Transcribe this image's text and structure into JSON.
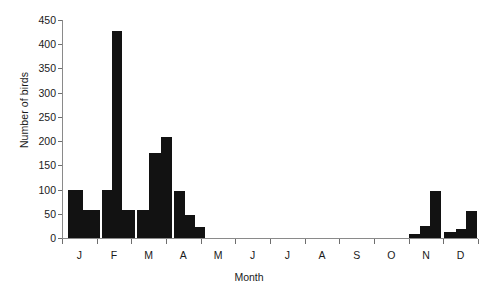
{
  "chart_data": {
    "type": "bar",
    "title": "",
    "xlabel": "Month",
    "ylabel": "Number of birds",
    "ylim": [
      0,
      450
    ],
    "y_ticks": [
      0,
      50,
      100,
      150,
      200,
      250,
      300,
      350,
      400,
      450
    ],
    "y_tick_labels": [
      "0",
      "50",
      "100",
      "150",
      "200",
      "250",
      "300",
      "350",
      "400",
      "450"
    ],
    "grid": false,
    "legend": null,
    "bar_color": "#121212",
    "axis_color": "#8a8a8a",
    "categories": [
      "J",
      "F",
      "M",
      "A",
      "M",
      "J",
      "J",
      "A",
      "S",
      "O",
      "N",
      "D"
    ],
    "x_tick_labels": [
      "J",
      "F",
      "M",
      "A",
      "M",
      "J",
      "J",
      "A",
      "S",
      "O",
      "N",
      "D"
    ],
    "note": "Bars are sub-monthly (approximately half-month) intervals across the 12 months.",
    "bins": [
      {
        "month": "J",
        "index": 0,
        "value": 100
      },
      {
        "month": "J",
        "index": 1,
        "value": 57
      },
      {
        "month": "F",
        "index": 2,
        "value": 100
      },
      {
        "month": "F",
        "index": 3,
        "value": 427
      },
      {
        "month": "F",
        "index": 4,
        "value": 57
      },
      {
        "month": "M",
        "index": 5,
        "value": 57
      },
      {
        "month": "M",
        "index": 6,
        "value": 175
      },
      {
        "month": "M",
        "index": 7,
        "value": 208
      },
      {
        "month": "A",
        "index": 8,
        "value": 97
      },
      {
        "month": "A",
        "index": 9,
        "value": 47
      },
      {
        "month": "A",
        "index": 10,
        "value": 23
      },
      {
        "month": "M",
        "index": 11,
        "value": 0
      },
      {
        "month": "J",
        "index": 12,
        "value": 0
      },
      {
        "month": "J",
        "index": 13,
        "value": 0
      },
      {
        "month": "A",
        "index": 14,
        "value": 0
      },
      {
        "month": "S",
        "index": 15,
        "value": 0
      },
      {
        "month": "O",
        "index": 16,
        "value": 0
      },
      {
        "month": "N",
        "index": 17,
        "value": 8
      },
      {
        "month": "N",
        "index": 18,
        "value": 25
      },
      {
        "month": "N",
        "index": 19,
        "value": 97
      },
      {
        "month": "D",
        "index": 20,
        "value": 13
      },
      {
        "month": "D",
        "index": 21,
        "value": 18
      },
      {
        "month": "D",
        "index": 22,
        "value": 55
      }
    ],
    "bars_px": [
      {
        "x": 68,
        "w": 15,
        "value": 100
      },
      {
        "x": 83,
        "w": 17,
        "value": 57
      },
      {
        "x": 102,
        "w": 10,
        "value": 100
      },
      {
        "x": 112,
        "w": 10,
        "value": 427
      },
      {
        "x": 122,
        "w": 13,
        "value": 57
      },
      {
        "x": 137,
        "w": 12,
        "value": 57
      },
      {
        "x": 149,
        "w": 12,
        "value": 175
      },
      {
        "x": 161,
        "w": 11,
        "value": 208
      },
      {
        "x": 174,
        "w": 11,
        "value": 97
      },
      {
        "x": 185,
        "w": 10,
        "value": 47
      },
      {
        "x": 195,
        "w": 10,
        "value": 23
      },
      {
        "x": 409,
        "w": 11,
        "value": 8
      },
      {
        "x": 420,
        "w": 10,
        "value": 25
      },
      {
        "x": 430,
        "w": 11,
        "value": 97
      },
      {
        "x": 444,
        "w": 12,
        "value": 13
      },
      {
        "x": 456,
        "w": 10,
        "value": 18
      },
      {
        "x": 466,
        "w": 11,
        "value": 55
      }
    ]
  },
  "axes": {
    "y_title": "Number of birds",
    "x_title": "Month"
  }
}
